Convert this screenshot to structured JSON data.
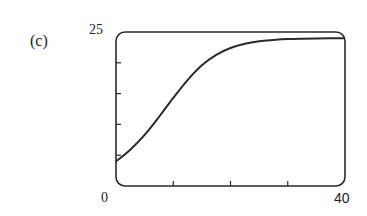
{
  "panel_label": "(c)",
  "axis_labels": {
    "y_max": "25",
    "x_min": "0",
    "x_max": "40"
  },
  "chart_data": {
    "type": "line",
    "title": "",
    "panel": "(c)",
    "xlabel": "",
    "ylabel": "",
    "xlim": [
      0,
      40
    ],
    "ylim": [
      0,
      25
    ],
    "x_ticks": [
      0,
      10,
      20,
      30,
      40
    ],
    "y_ticks": [
      0,
      5,
      10,
      15,
      20,
      25
    ],
    "x_tick_labels_shown": [
      "0",
      "40"
    ],
    "y_tick_labels_shown": [
      "25"
    ],
    "grid": false,
    "legend": null,
    "series": [
      {
        "name": "logistic curve",
        "x": [
          0,
          2.5,
          5,
          7.5,
          10,
          12.5,
          15,
          17.5,
          20,
          22.5,
          25,
          27.5,
          30,
          32.5,
          35,
          37.5,
          40
        ],
        "y": [
          4.0,
          5.9,
          8.3,
          11.2,
          14.3,
          17.2,
          19.6,
          21.3,
          22.4,
          23.1,
          23.5,
          23.7,
          23.85,
          23.92,
          23.96,
          23.98,
          23.99
        ]
      }
    ],
    "colors": {
      "line": "#2a2a2a",
      "frame": "#2a2a2a"
    }
  }
}
